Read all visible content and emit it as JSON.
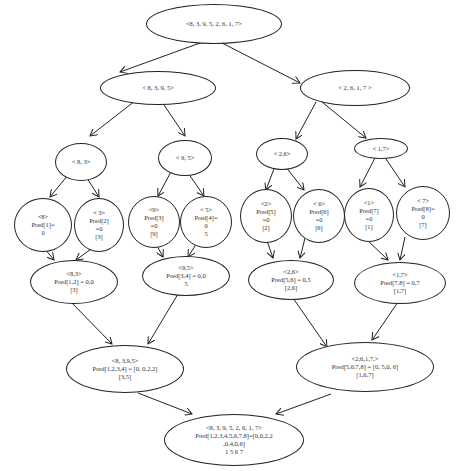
{
  "diagram": {
    "type": "merge-sort-recursion-tree",
    "nodes": {
      "root": {
        "lines": [
          "<8, 3, 9, 5, 2, 6, 1, 7>"
        ]
      },
      "l1a": {
        "lines": [
          "< 8, 3, 9, 5>"
        ]
      },
      "l1b": {
        "lines": [
          "< 2, 6, 1, 7 >"
        ]
      },
      "l2a": {
        "lines": [
          "< 8, 3>"
        ]
      },
      "l2b": {
        "lines": [
          "< 9, 5>"
        ]
      },
      "l2c": {
        "lines": [
          "< 2,6>"
        ]
      },
      "l2d": {
        "lines": [
          "< 1,7>"
        ]
      },
      "leaf1": {
        "lines": [
          "<8>",
          "Pred[1]=",
          "0"
        ]
      },
      "leaf2": {
        "lines": [
          "< 3>",
          "Pred[2]",
          "=0",
          "[3]"
        ]
      },
      "leaf3": {
        "lines": [
          "<9>",
          "Pred[3]",
          "=0",
          "[9]"
        ]
      },
      "leaf4": {
        "lines": [
          "< 5>",
          "Pred[4]=",
          "0",
          "5"
        ]
      },
      "leaf5": {
        "lines": [
          "<2>",
          "Pred[5]",
          "=0",
          "[2]"
        ]
      },
      "leaf6": {
        "lines": [
          "< 6>",
          "Pred[6]",
          "=0",
          "[6]"
        ]
      },
      "leaf7": {
        "lines": [
          "<1>",
          "Pred[7]",
          "=0",
          "[1]"
        ]
      },
      "leaf8": {
        "lines": [
          "< 7>",
          "Pred[8]=",
          "0",
          "[7]"
        ]
      },
      "m2a": {
        "lines": [
          "<8,3>",
          "Pred[1,2] = 0,0",
          "[3]"
        ]
      },
      "m2b": {
        "lines": [
          "<9,5>",
          "Pred[3,4] = 0,0",
          "5"
        ]
      },
      "m2c": {
        "lines": [
          "<2,6>",
          "Pred[5,6] = 0,5",
          "[2,6]"
        ]
      },
      "m2d": {
        "lines": [
          "<1,7>",
          "Pred[7,8] = 0,7",
          "[1,7]"
        ]
      },
      "m1a": {
        "lines": [
          "<8, 3,9,5>",
          "Pred[1,2,3,4] = [0, 0,2,2]",
          "[3,5]"
        ]
      },
      "m1b": {
        "lines": [
          "<2,6,1,7,>",
          "Pred[5,6,7,8] = [0, 5,0, 6]",
          "[1,6,7]"
        ]
      },
      "final": {
        "lines": [
          "<8, 3, 9, 5, 2, 6, 1, 7>",
          "Pred[1,2,3,4,5,6,7,8]=[0,0,2,2",
          ",0,4,0,6]",
          "1 5 6 7"
        ]
      }
    },
    "edges": [
      [
        "root",
        "l1a"
      ],
      [
        "root",
        "l1b"
      ],
      [
        "l1a",
        "l2a"
      ],
      [
        "l1a",
        "l2b"
      ],
      [
        "l1b",
        "l2c"
      ],
      [
        "l1b",
        "l2d"
      ],
      [
        "l2a",
        "leaf1"
      ],
      [
        "l2a",
        "leaf2"
      ],
      [
        "l2b",
        "leaf3"
      ],
      [
        "l2b",
        "leaf4"
      ],
      [
        "l2c",
        "leaf5"
      ],
      [
        "l2c",
        "leaf6"
      ],
      [
        "l2d",
        "leaf7"
      ],
      [
        "l2d",
        "leaf8"
      ],
      [
        "leaf1",
        "m2a"
      ],
      [
        "leaf2",
        "m2a"
      ],
      [
        "leaf3",
        "m2b"
      ],
      [
        "leaf4",
        "m2b"
      ],
      [
        "leaf5",
        "m2c"
      ],
      [
        "leaf6",
        "m2c"
      ],
      [
        "leaf7",
        "m2d"
      ],
      [
        "leaf8",
        "m2d"
      ],
      [
        "m2a",
        "m1a"
      ],
      [
        "m2b",
        "m1a"
      ],
      [
        "m2c",
        "m1b"
      ],
      [
        "m2d",
        "m1b"
      ],
      [
        "m1a",
        "final"
      ],
      [
        "m1b",
        "final"
      ]
    ],
    "colors": {
      "stroke": "#222222",
      "text": "#333333",
      "background": "#ffffff"
    }
  }
}
